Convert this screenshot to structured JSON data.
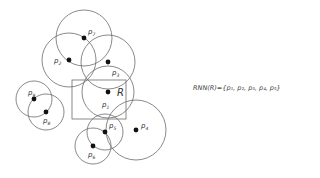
{
  "diagram": {
    "region": {
      "label": "R",
      "x": 72,
      "y": 80,
      "width": 54,
      "height": 39
    },
    "points": [
      {
        "id": "p1",
        "label": "p",
        "sub": "1",
        "x": 108,
        "y": 92,
        "r": 26,
        "lx": 102,
        "ly": 107
      },
      {
        "id": "p2",
        "label": "p",
        "sub": "2",
        "x": 69,
        "y": 60,
        "r": 27,
        "lx": 54,
        "ly": 63
      },
      {
        "id": "p3",
        "label": "p",
        "sub": "3",
        "x": 108,
        "y": 62,
        "r": 27,
        "lx": 112,
        "ly": 75
      },
      {
        "id": "p4",
        "label": "p",
        "sub": "4",
        "x": 136,
        "y": 130,
        "r": 30,
        "lx": 141,
        "ly": 128
      },
      {
        "id": "p5",
        "label": "p",
        "sub": "5",
        "x": 105,
        "y": 132,
        "r": 18,
        "lx": 109,
        "ly": 128
      },
      {
        "id": "p6",
        "label": "p",
        "sub": "6",
        "x": 93,
        "y": 146,
        "r": 18,
        "lx": 88,
        "ly": 157
      },
      {
        "id": "p7",
        "label": "p",
        "sub": "7",
        "x": 84,
        "y": 38,
        "r": 28,
        "lx": 88,
        "ly": 34
      },
      {
        "id": "p8",
        "label": "p",
        "sub": "8",
        "x": 46,
        "y": 112,
        "r": 18,
        "lx": 43,
        "ly": 123
      },
      {
        "id": "p9",
        "label": "p",
        "sub": "9",
        "x": 34,
        "y": 99,
        "r": 18,
        "lx": 28,
        "ly": 95
      }
    ],
    "formula": "RNN(R)={p₁, p₂, p₃, p₄, p₅}"
  }
}
